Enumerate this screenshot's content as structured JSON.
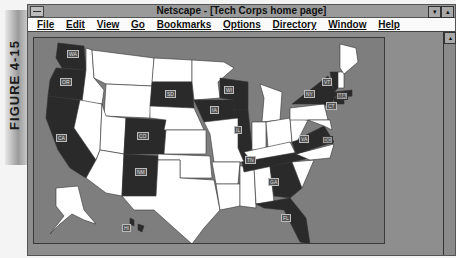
{
  "figure_label": "FIGURE 4-15",
  "window": {
    "title": "Netscape - [Tech Corps home page]",
    "controls": {
      "minimize": "▾",
      "maximize": "▴"
    }
  },
  "menu": [
    "File",
    "Edit",
    "View",
    "Go",
    "Bookmarks",
    "Options",
    "Directory",
    "Window",
    "Help"
  ],
  "map": {
    "description": "United States clickable map",
    "highlighted_states": [
      "WA",
      "OR",
      "CA",
      "SD",
      "CO",
      "NM",
      "IA",
      "WI",
      "IL",
      "TN",
      "GA",
      "FL",
      "VA",
      "DC",
      "NY",
      "VT",
      "MA",
      "CT",
      "HI"
    ],
    "labels": {
      "WA": "WA",
      "OR": "OR",
      "CA": "CA",
      "SD": "SD",
      "CO": "CO",
      "NM": "NM",
      "IA": "IA",
      "WI": "WI",
      "IL": "IL",
      "TN": "TN",
      "GA": "GA",
      "FL": "FL",
      "VA": "VA",
      "DC": "DC",
      "NY": "NY",
      "VT": "VT",
      "MA": "MA",
      "CT": "CT",
      "HI": "HI"
    },
    "colors": {
      "highlighted": "#2a2a2a",
      "other": "#ffffff",
      "water": "#7e7e7e"
    }
  },
  "scrollbar": {
    "up_arrow": "▴"
  }
}
